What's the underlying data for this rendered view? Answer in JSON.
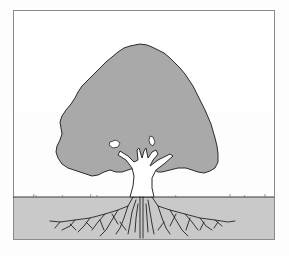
{
  "illustration": {
    "subject": "tree with canopy, trunk and root system",
    "colors": {
      "background": "#fdfdfd",
      "frame": "#8a8a8a",
      "canopy_fill": "#a9a9a9",
      "canopy_outline": "#2a2a2a",
      "soil_fill": "#c9c9c9",
      "ground_line": "#3a3a3a",
      "roots": "#222222",
      "trunk_fill": "#ffffff"
    }
  }
}
